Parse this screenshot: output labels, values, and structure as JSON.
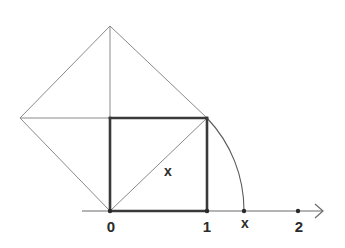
{
  "diagram": {
    "labels": {
      "origin": "0",
      "one": "1",
      "x_axis_point": "x",
      "two": "2",
      "diagonal": "x"
    },
    "colors": {
      "thin_line": "#8a8a8a",
      "square_edge": "#3a3a3a",
      "axis": "#6a6a6a",
      "text": "#2b2b2b"
    },
    "points": {
      "origin": [
        110,
        211
      ],
      "one": [
        207,
        211
      ],
      "x_on_axis": [
        244,
        211
      ],
      "two": [
        298,
        211
      ],
      "square_top_left": [
        110,
        118
      ],
      "square_top_right": [
        207,
        118
      ],
      "top_vertex": [
        110,
        26
      ],
      "left_vertex": [
        20,
        118
      ]
    }
  }
}
